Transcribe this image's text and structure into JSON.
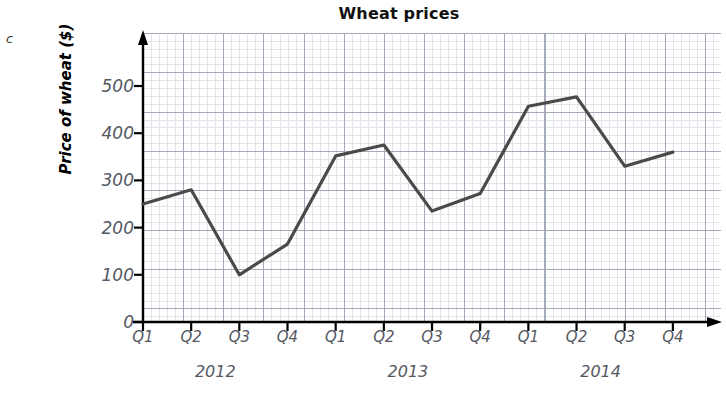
{
  "part_label": "c",
  "chart_data": {
    "type": "line",
    "title": "Wheat prices",
    "xlabel": "",
    "ylabel": "Price of wheat ($)",
    "categories": [
      "Q1",
      "Q2",
      "Q3",
      "Q4",
      "Q1",
      "Q2",
      "Q3",
      "Q4",
      "Q1",
      "Q2",
      "Q3",
      "Q4"
    ],
    "group_labels": [
      "2012",
      "2013",
      "2014"
    ],
    "values": [
      250,
      280,
      100,
      165,
      352,
      375,
      235,
      272,
      457,
      477,
      330,
      360
    ],
    "series": [
      {
        "name": "Price of wheat",
        "values": [
          250,
          280,
          100,
          165,
          352,
          375,
          235,
          272,
          457,
          477,
          330,
          360
        ]
      }
    ],
    "points": [
      {
        "year": "2012",
        "quarter": "Q1",
        "value": 250
      },
      {
        "year": "2012",
        "quarter": "Q2",
        "value": 280
      },
      {
        "year": "2012",
        "quarter": "Q3",
        "value": 100
      },
      {
        "year": "2012",
        "quarter": "Q4",
        "value": 165
      },
      {
        "year": "2013",
        "quarter": "Q1",
        "value": 352
      },
      {
        "year": "2013",
        "quarter": "Q2",
        "value": 375
      },
      {
        "year": "2013",
        "quarter": "Q3",
        "value": 235
      },
      {
        "year": "2013",
        "quarter": "Q4",
        "value": 272
      },
      {
        "year": "2014",
        "quarter": "Q1",
        "value": 457
      },
      {
        "year": "2014",
        "quarter": "Q2",
        "value": 477
      },
      {
        "year": "2014",
        "quarter": "Q3",
        "value": 330
      },
      {
        "year": "2014",
        "quarter": "Q4",
        "value": 360
      }
    ],
    "ytick_labels": [
      "0",
      "100",
      "200",
      "300",
      "400",
      "500"
    ],
    "ytick_values": [
      0,
      100,
      200,
      300,
      400,
      500
    ],
    "ylim": [
      0,
      580
    ],
    "grid": true,
    "legend": false,
    "line_color": "#4a4a4a",
    "grid_minor_color": "#d9dce6",
    "grid_major_color": "#9aa0b0",
    "axis_color": "#000000"
  }
}
